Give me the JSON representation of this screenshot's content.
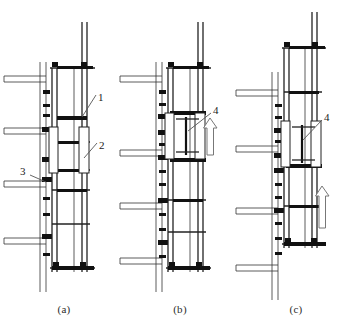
{
  "figure": {
    "type": "engineering-line-drawing",
    "background_color": "#ffffff",
    "line_color": "#222222",
    "panel_count": 3
  },
  "panels": [
    {
      "id": "a",
      "caption": "(a)",
      "description": "Scaffold in working position attached to building floors",
      "callouts": [
        {
          "label": "1",
          "x": 100,
          "y": 100,
          "points_to": "upper-truss-beam"
        },
        {
          "label": "2",
          "x": 101,
          "y": 147,
          "points_to": "guide-seat-bracket"
        },
        {
          "label": "3",
          "x": 21,
          "y": 172,
          "points_to": "wall-anchor-clamp"
        }
      ],
      "has_motion_arrow": false
    },
    {
      "id": "b",
      "caption": "(b)",
      "description": "Lifting device engaged, hoist shown with upward motion arrow",
      "callouts": [
        {
          "label": "4",
          "x": 214,
          "y": 112,
          "points_to": "electric-hoist"
        }
      ],
      "has_motion_arrow": true,
      "motion_arrow": {
        "direction": "up",
        "x": 206,
        "y": 128
      }
    },
    {
      "id": "c",
      "caption": "(c)",
      "description": "Scaffold body raised one storey, hoist repositioned",
      "callouts": [
        {
          "label": "4",
          "x": 325,
          "y": 116,
          "points_to": "electric-hoist"
        }
      ],
      "has_motion_arrow": true,
      "motion_arrow": {
        "direction": "up",
        "x": 316,
        "y": 195
      }
    }
  ],
  "legend": {
    "items": [
      {
        "number": "1",
        "name": "horizontal-support-truss"
      },
      {
        "number": "2",
        "name": "guide-seat-bracket"
      },
      {
        "number": "3",
        "name": "wall-anchor-clamp"
      },
      {
        "number": "4",
        "name": "electric-hoist"
      }
    ]
  },
  "building": {
    "floor_slab_count": 4,
    "wall_column": "vertical-concrete-column"
  }
}
